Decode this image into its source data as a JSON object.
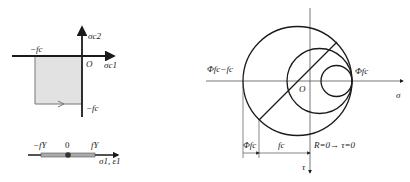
{
  "left_top_diagram": {
    "axis_y_label": "σc2",
    "axis_x_label": "σc1",
    "origin_label": "O",
    "neg_fc_x_label": "−fc",
    "neg_fc_y_label": "−fc",
    "region_fill": "#e4e4e4"
  },
  "left_bottom_diagram": {
    "neg_label": "−fY",
    "zero_label": "0",
    "pos_label": "fY",
    "axis_label": "σ1, ε1"
  },
  "right_diagram": {
    "sigma_axis_label": "σ",
    "tau_axis_label": "τ",
    "origin_label": "O",
    "left_point_label": "Φfc−fc",
    "right_point_label": "Φfc",
    "dim_left_label": "Φfc",
    "dim_right_label": "fc",
    "note_label": "R=0→ τ=0",
    "circles": [
      {
        "name": "large",
        "cx": 297.5,
        "cy": 81,
        "r": 54.5
      },
      {
        "name": "medium",
        "cx": 319.5,
        "cy": 81,
        "r": 32.5
      },
      {
        "name": "small",
        "cx": 336.5,
        "cy": 81,
        "r": 15.5
      }
    ]
  },
  "colors": {
    "stroke": "#1a1a1a",
    "thin_stroke": "#555555",
    "fill": "#e4e4e4"
  }
}
